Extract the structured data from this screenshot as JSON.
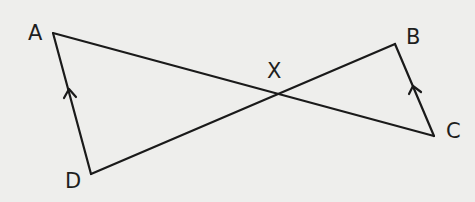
{
  "diagram": {
    "type": "geometry",
    "background": "#eeeeec",
    "stroke_color": "#1a1a1a",
    "points": {
      "A": {
        "label": "A",
        "x": 53,
        "y": 33
      },
      "B": {
        "label": "B",
        "x": 395,
        "y": 44
      },
      "C": {
        "label": "C",
        "x": 434,
        "y": 136
      },
      "D": {
        "label": "D",
        "x": 91,
        "y": 174
      },
      "X": {
        "label": "X",
        "x": 278,
        "y": 95
      }
    },
    "segments": [
      "AD",
      "AC",
      "DB",
      "BC"
    ],
    "parallel_marks": [
      "AD",
      "BC"
    ],
    "intersection": "X"
  }
}
